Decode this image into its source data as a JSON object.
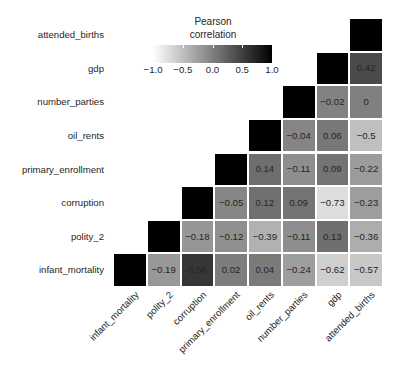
{
  "chart_data": {
    "type": "heatmap",
    "title": "",
    "legend": {
      "title_line1": "Pearson",
      "title_line2": "correlation",
      "position": "top-center",
      "colormap": "grayscale-white-to-black",
      "ticks": [
        "-1.0",
        "-0.5",
        "0.0",
        "0.5",
        "1.0"
      ],
      "tick_values": [
        -1.0,
        -0.5,
        0.0,
        0.5,
        1.0
      ],
      "vmin": -1.0,
      "vmax": 1.0
    },
    "xlabel": "",
    "ylabel": "",
    "grid": false,
    "x_categories": [
      "infant_mortality",
      "polity_2",
      "corruption",
      "primary_enrollment",
      "oil_rents",
      "number_parties",
      "gdp",
      "attended_births"
    ],
    "y_categories": [
      "attended_births",
      "gdp",
      "number_parties",
      "oil_rents",
      "primary_enrollment",
      "corruption",
      "polity_2",
      "infant_mortality"
    ],
    "note": "Upper-left triangle is blank; diagonal cells are solid black (self-correlation = 1) and unlabeled.",
    "rows": [
      {
        "label": "attended_births",
        "cells": [
          {
            "value": null,
            "text": "",
            "state": "blank"
          },
          {
            "value": null,
            "text": "",
            "state": "blank"
          },
          {
            "value": null,
            "text": "",
            "state": "blank"
          },
          {
            "value": null,
            "text": "",
            "state": "blank"
          },
          {
            "value": null,
            "text": "",
            "state": "blank"
          },
          {
            "value": null,
            "text": "",
            "state": "blank"
          },
          {
            "value": null,
            "text": "",
            "state": "blank"
          },
          {
            "value": 1,
            "text": "",
            "state": "diagonal"
          }
        ]
      },
      {
        "label": "gdp",
        "cells": [
          {
            "value": null,
            "text": "",
            "state": "blank"
          },
          {
            "value": null,
            "text": "",
            "state": "blank"
          },
          {
            "value": null,
            "text": "",
            "state": "blank"
          },
          {
            "value": null,
            "text": "",
            "state": "blank"
          },
          {
            "value": null,
            "text": "",
            "state": "blank"
          },
          {
            "value": null,
            "text": "",
            "state": "blank"
          },
          {
            "value": 1,
            "text": "",
            "state": "diagonal"
          },
          {
            "value": 0.42,
            "text": "0.42",
            "state": "value"
          }
        ]
      },
      {
        "label": "number_parties",
        "cells": [
          {
            "value": null,
            "text": "",
            "state": "blank"
          },
          {
            "value": null,
            "text": "",
            "state": "blank"
          },
          {
            "value": null,
            "text": "",
            "state": "blank"
          },
          {
            "value": null,
            "text": "",
            "state": "blank"
          },
          {
            "value": null,
            "text": "",
            "state": "blank"
          },
          {
            "value": 1,
            "text": "",
            "state": "diagonal"
          },
          {
            "value": -0.02,
            "text": "−0.02",
            "state": "value"
          },
          {
            "value": 0,
            "text": "0",
            "state": "value"
          }
        ]
      },
      {
        "label": "oil_rents",
        "cells": [
          {
            "value": null,
            "text": "",
            "state": "blank"
          },
          {
            "value": null,
            "text": "",
            "state": "blank"
          },
          {
            "value": null,
            "text": "",
            "state": "blank"
          },
          {
            "value": null,
            "text": "",
            "state": "blank"
          },
          {
            "value": 1,
            "text": "",
            "state": "diagonal"
          },
          {
            "value": -0.04,
            "text": "−0.04",
            "state": "value"
          },
          {
            "value": 0.06,
            "text": "0.06",
            "state": "value"
          },
          {
            "value": -0.5,
            "text": "−0.5",
            "state": "value"
          }
        ]
      },
      {
        "label": "primary_enrollment",
        "cells": [
          {
            "value": null,
            "text": "",
            "state": "blank"
          },
          {
            "value": null,
            "text": "",
            "state": "blank"
          },
          {
            "value": null,
            "text": "",
            "state": "blank"
          },
          {
            "value": 1,
            "text": "",
            "state": "diagonal"
          },
          {
            "value": 0.14,
            "text": "0.14",
            "state": "value"
          },
          {
            "value": -0.11,
            "text": "−0.11",
            "state": "value"
          },
          {
            "value": 0.09,
            "text": "0.09",
            "state": "value"
          },
          {
            "value": -0.22,
            "text": "−0.22",
            "state": "value"
          }
        ]
      },
      {
        "label": "corruption",
        "cells": [
          {
            "value": null,
            "text": "",
            "state": "blank"
          },
          {
            "value": null,
            "text": "",
            "state": "blank"
          },
          {
            "value": 1,
            "text": "",
            "state": "diagonal"
          },
          {
            "value": -0.05,
            "text": "−0.05",
            "state": "value"
          },
          {
            "value": 0.12,
            "text": "0.12",
            "state": "value"
          },
          {
            "value": 0.09,
            "text": "0.09",
            "state": "value"
          },
          {
            "value": -0.73,
            "text": "−0.73",
            "state": "value"
          },
          {
            "value": -0.23,
            "text": "−0.23",
            "state": "value"
          }
        ]
      },
      {
        "label": "polity_2",
        "cells": [
          {
            "value": null,
            "text": "",
            "state": "blank"
          },
          {
            "value": 1,
            "text": "",
            "state": "diagonal"
          },
          {
            "value": -0.18,
            "text": "−0.18",
            "state": "value"
          },
          {
            "value": -0.12,
            "text": "−0.12",
            "state": "value"
          },
          {
            "value": -0.39,
            "text": "−0.39",
            "state": "value"
          },
          {
            "value": -0.11,
            "text": "−0.11",
            "state": "value"
          },
          {
            "value": 0.13,
            "text": "0.13",
            "state": "value"
          },
          {
            "value": -0.36,
            "text": "−0.36",
            "state": "value"
          }
        ]
      },
      {
        "label": "infant_mortality",
        "cells": [
          {
            "value": 1,
            "text": "",
            "state": "diagonal"
          },
          {
            "value": -0.19,
            "text": "−0.19",
            "state": "value"
          },
          {
            "value": 0.58,
            "text": "0.58",
            "state": "value"
          },
          {
            "value": 0.02,
            "text": "0.02",
            "state": "value"
          },
          {
            "value": 0.04,
            "text": "0.04",
            "state": "value"
          },
          {
            "value": -0.24,
            "text": "−0.24",
            "state": "value"
          },
          {
            "value": -0.62,
            "text": "−0.62",
            "state": "value"
          },
          {
            "value": -0.57,
            "text": "−0.57",
            "state": "value"
          }
        ]
      }
    ]
  }
}
